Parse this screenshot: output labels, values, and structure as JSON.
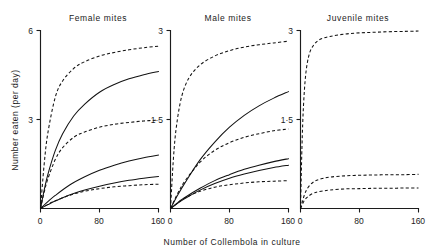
{
  "figure": {
    "xlabel": "Number of Collembola in culture",
    "ylabel": "Number eaten (per day)"
  },
  "panels": [
    {
      "key": "female",
      "title": "Female mites",
      "ytop_label": "6",
      "ymid_label": "3",
      "x_ticks": [
        "0",
        "80",
        "160"
      ]
    },
    {
      "key": "male",
      "title": "Male mites",
      "ytop_label": "3",
      "ymid_label": "1·5",
      "x_ticks": [
        "0",
        "80",
        "160"
      ]
    },
    {
      "key": "juvenile",
      "title": "Juvenile mites",
      "ytop_label": "3",
      "ymid_label": "1·5",
      "x_ticks": [
        "0",
        "80",
        "160"
      ]
    }
  ],
  "chart_data": {
    "type": "line",
    "title": "",
    "xlabel": "Number of Collembola in culture",
    "ylabel": "Number eaten (per day)",
    "xlim": [
      0,
      160
    ],
    "grid": false,
    "legend": "none",
    "panels": [
      {
        "name": "Female mites",
        "ylim": [
          0,
          6
        ],
        "yticks": [
          0,
          3,
          6
        ],
        "xticks": [
          0,
          80,
          160
        ],
        "series": [
          {
            "name": "female-curve-1",
            "style": "dashed",
            "x": [
              0,
              5,
              10,
              20,
              30,
              45,
              60,
              80,
              100,
              120,
              140,
              160
            ],
            "y": [
              0,
              1.5,
              2.55,
              3.75,
              4.3,
              4.72,
              4.95,
              5.14,
              5.26,
              5.35,
              5.42,
              5.47
            ]
          },
          {
            "name": "female-curve-2",
            "style": "solid",
            "x": [
              0,
              5,
              10,
              20,
              30,
              45,
              60,
              80,
              100,
              120,
              140,
              160
            ],
            "y": [
              0,
              0.62,
              1.15,
              1.95,
              2.52,
              3.12,
              3.52,
              3.92,
              4.18,
              4.37,
              4.51,
              4.62
            ]
          },
          {
            "name": "female-curve-3",
            "style": "dashed",
            "x": [
              0,
              5,
              10,
              20,
              30,
              45,
              60,
              80,
              100,
              120,
              140,
              160
            ],
            "y": [
              0,
              0.55,
              1.0,
              1.65,
              2.05,
              2.4,
              2.58,
              2.74,
              2.84,
              2.9,
              2.95,
              2.98
            ]
          },
          {
            "name": "female-curve-4",
            "style": "solid",
            "x": [
              0,
              10,
              20,
              40,
              60,
              80,
              100,
              120,
              140,
              160
            ],
            "y": [
              0,
              0.23,
              0.44,
              0.8,
              1.07,
              1.29,
              1.46,
              1.6,
              1.71,
              1.8
            ]
          },
          {
            "name": "female-curve-5",
            "style": "solid",
            "x": [
              0,
              10,
              20,
              40,
              60,
              80,
              100,
              120,
              140,
              160
            ],
            "y": [
              0,
              0.13,
              0.25,
              0.46,
              0.62,
              0.75,
              0.86,
              0.95,
              1.02,
              1.08
            ]
          },
          {
            "name": "female-curve-6",
            "style": "dashed",
            "x": [
              0,
              10,
              20,
              40,
              60,
              80,
              100,
              120,
              140,
              160
            ],
            "y": [
              0,
              0.14,
              0.26,
              0.45,
              0.58,
              0.67,
              0.73,
              0.77,
              0.8,
              0.82
            ]
          }
        ]
      },
      {
        "name": "Male mites",
        "ylim": [
          0,
          3
        ],
        "yticks": [
          0,
          1.5,
          3
        ],
        "xticks": [
          0,
          80,
          160
        ],
        "series": [
          {
            "name": "male-curve-1",
            "style": "dashed",
            "x": [
              0,
              4,
              8,
              15,
              25,
              40,
              60,
              80,
              100,
              120,
              140,
              160
            ],
            "y": [
              0,
              0.85,
              1.38,
              1.88,
              2.2,
              2.42,
              2.57,
              2.66,
              2.72,
              2.76,
              2.79,
              2.82
            ]
          },
          {
            "name": "male-curve-2",
            "style": "solid",
            "x": [
              0,
              10,
              20,
              40,
              60,
              80,
              100,
              120,
              140,
              160
            ],
            "y": [
              0,
              0.23,
              0.44,
              0.82,
              1.12,
              1.37,
              1.57,
              1.73,
              1.86,
              1.97
            ]
          },
          {
            "name": "male-curve-3",
            "style": "dashed",
            "x": [
              0,
              10,
              20,
              40,
              60,
              80,
              100,
              120,
              140,
              160
            ],
            "y": [
              0,
              0.26,
              0.47,
              0.78,
              0.98,
              1.11,
              1.2,
              1.26,
              1.31,
              1.34
            ]
          },
          {
            "name": "male-curve-4",
            "style": "solid",
            "x": [
              0,
              10,
              20,
              40,
              60,
              80,
              100,
              120,
              140,
              160
            ],
            "y": [
              0,
              0.1,
              0.19,
              0.34,
              0.47,
              0.57,
              0.66,
              0.73,
              0.79,
              0.84
            ]
          },
          {
            "name": "male-curve-5",
            "style": "solid",
            "x": [
              0,
              10,
              20,
              40,
              60,
              80,
              100,
              120,
              140,
              160
            ],
            "y": [
              0,
              0.09,
              0.17,
              0.31,
              0.42,
              0.51,
              0.58,
              0.64,
              0.69,
              0.73
            ]
          },
          {
            "name": "male-curve-6",
            "style": "dashed",
            "x": [
              0,
              10,
              20,
              40,
              60,
              80,
              100,
              120,
              140,
              160
            ],
            "y": [
              0,
              0.1,
              0.18,
              0.29,
              0.36,
              0.4,
              0.43,
              0.45,
              0.46,
              0.47
            ]
          }
        ]
      },
      {
        "name": "Juvenile mites",
        "ylim": [
          0,
          3
        ],
        "yticks": [
          0,
          1.5,
          3
        ],
        "xticks": [
          0,
          80,
          160
        ],
        "series": [
          {
            "name": "juvenile-curve-1",
            "style": "dashed",
            "x": [
              0,
              2,
              4,
              7,
              11,
              16,
              25,
              40,
              60,
              80,
              100,
              120,
              140,
              160
            ],
            "y": [
              0,
              1.05,
              1.72,
              2.25,
              2.56,
              2.72,
              2.84,
              2.9,
              2.94,
              2.96,
              2.97,
              2.98,
              2.985,
              2.99
            ]
          },
          {
            "name": "juvenile-curve-2",
            "style": "dashed",
            "x": [
              0,
              5,
              10,
              18,
              28,
              40,
              60,
              80,
              100,
              120,
              140,
              160
            ],
            "y": [
              0,
              0.22,
              0.35,
              0.45,
              0.5,
              0.53,
              0.55,
              0.56,
              0.565,
              0.57,
              0.57,
              0.575
            ]
          },
          {
            "name": "juvenile-curve-3",
            "style": "dashed",
            "x": [
              0,
              5,
              10,
              18,
              28,
              40,
              60,
              80,
              100,
              120,
              140,
              160
            ],
            "y": [
              0,
              0.13,
              0.2,
              0.26,
              0.29,
              0.31,
              0.33,
              0.335,
              0.34,
              0.34,
              0.345,
              0.345
            ]
          }
        ]
      }
    ]
  }
}
